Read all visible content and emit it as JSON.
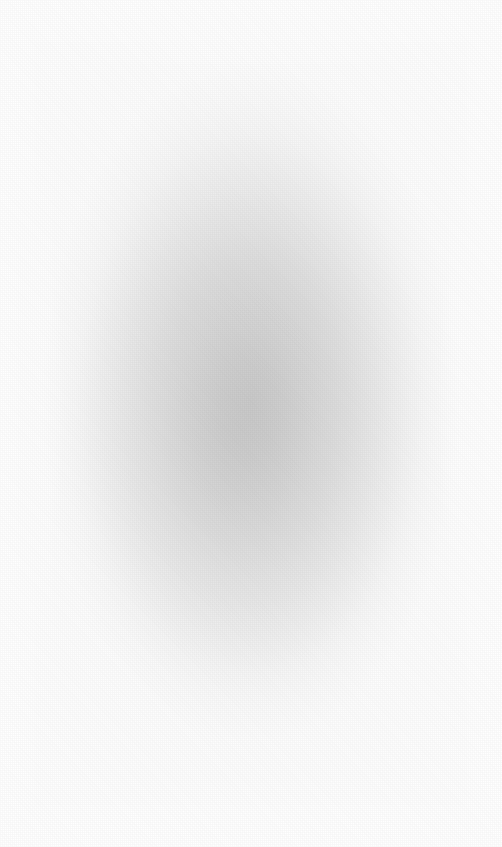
{
  "image": {
    "kind": "blurred-gradient",
    "description": "Heavily defocused / blurred photograph with no legible content",
    "width": 502,
    "height": 847,
    "has_text": false,
    "has_ui_elements": false,
    "background_color": "#ffffff",
    "edge_color": "#fefefe",
    "core_color": "#cdcdcd",
    "midtone_color": "#d9d9d9",
    "falloff_color": "#f0f0f0",
    "halo_color": "#c3c3c3",
    "grain_opacity": "0.04"
  },
  "gradient": {
    "shape": "ellipse",
    "center_x_px": 251,
    "center_y_px": 403,
    "center_x_pct": "50%",
    "center_y_pct": "47.6%",
    "radius_x_px": 210,
    "radius_y_px": 340,
    "halo_radius_x_px": 300,
    "halo_radius_y_px": 470,
    "stops": [
      {
        "offset": "0%",
        "color": "#cdcdcd"
      },
      {
        "offset": "12%",
        "color": "#d2d2d2"
      },
      {
        "offset": "25%",
        "color": "#d9d9d9"
      },
      {
        "offset": "38%",
        "color": "#e1e1e1"
      },
      {
        "offset": "51%",
        "color": "#e9e9e9"
      },
      {
        "offset": "64%",
        "color": "#f0f0f0"
      },
      {
        "offset": "77%",
        "color": "#f6f6f6"
      },
      {
        "offset": "89%",
        "color": "#fbfbfb"
      },
      {
        "offset": "100%",
        "color": "#fefefe"
      }
    ]
  },
  "samples": [
    {
      "region": "top-left-corner",
      "x": 10,
      "y": 10,
      "color": "#ffffff"
    },
    {
      "region": "top-center",
      "x": 251,
      "y": 80,
      "color": "#fafafa"
    },
    {
      "region": "top-right-corner",
      "x": 492,
      "y": 10,
      "color": "#ffffff"
    },
    {
      "region": "left-edge-mid",
      "x": 10,
      "y": 403,
      "color": "#fdfdfd"
    },
    {
      "region": "left-midtone",
      "x": 120,
      "y": 403,
      "color": "#f2f2f2"
    },
    {
      "region": "center-core",
      "x": 251,
      "y": 403,
      "color": "#cdcdcd"
    },
    {
      "region": "right-midtone",
      "x": 380,
      "y": 403,
      "color": "#ebebeb"
    },
    {
      "region": "right-edge-mid",
      "x": 492,
      "y": 403,
      "color": "#fdfdfd"
    },
    {
      "region": "bottom-center",
      "x": 251,
      "y": 720,
      "color": "#f7f7f7"
    },
    {
      "region": "bottom-left-corner",
      "x": 10,
      "y": 837,
      "color": "#ffffff"
    },
    {
      "region": "bottom-right-corner",
      "x": 492,
      "y": 837,
      "color": "#fefefe"
    }
  ]
}
